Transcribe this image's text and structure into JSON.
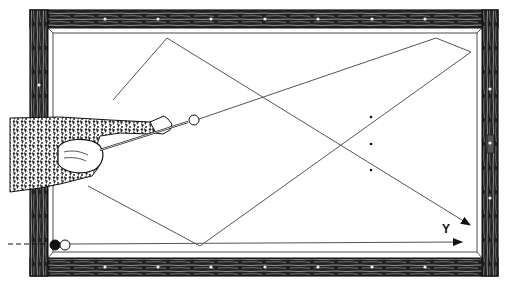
{
  "figure": {
    "label_y": "Y"
  },
  "colors": {
    "ink": "#111111",
    "line": "#555555",
    "rail_wood": "#1a1a1a",
    "background": "#ffffff"
  },
  "table": {
    "outer": [
      30,
      10,
      498,
      276
    ],
    "cushion": [
      48,
      28,
      482,
      258
    ],
    "inner": [
      53,
      33,
      477,
      252
    ]
  },
  "paths": [
    {
      "name": "path-1",
      "points": [
        [
          113,
          100
        ],
        [
          167,
          38
        ],
        [
          470,
          225
        ]
      ],
      "arrow": true
    },
    {
      "name": "path-2",
      "points": [
        [
          199,
          119
        ],
        [
          436,
          38
        ],
        [
          471,
          52
        ],
        [
          200,
          246
        ]
      ],
      "arrow": false
    },
    {
      "name": "path-3",
      "points": [
        [
          88,
          186
        ],
        [
          200,
          246
        ]
      ],
      "arrow": false
    },
    {
      "name": "path-y",
      "points": [
        [
          70,
          244
        ],
        [
          462,
          242
        ]
      ],
      "arrow": true
    }
  ],
  "dots": [
    [
      371,
      117
    ],
    [
      371,
      144
    ],
    [
      371,
      170
    ]
  ],
  "balls": [
    {
      "name": "cue-ball-aim",
      "cx": 194,
      "cy": 120,
      "r": 5,
      "fill": "#ffffff"
    },
    {
      "name": "black-ball",
      "cx": 55,
      "cy": 245,
      "r": 5,
      "fill": "#111111"
    },
    {
      "name": "white-ball",
      "cx": 65,
      "cy": 245,
      "r": 5,
      "fill": "#ffffff"
    }
  ],
  "diamonds_top": [
    105,
    158,
    211,
    265,
    318,
    372,
    425
  ],
  "diamonds_bottom": [
    105,
    158,
    211,
    265,
    318,
    372,
    425
  ],
  "diamonds_right": [
    89,
    143,
    198
  ]
}
